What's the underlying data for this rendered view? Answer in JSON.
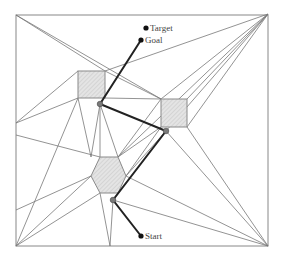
{
  "diagram": {
    "title": "",
    "labels": {
      "target": "Target",
      "goal": "Goal",
      "start": "Start"
    },
    "colors": {
      "border": "#888888",
      "edge": "#777777",
      "obstacle_fill": "#d9d9d9",
      "obstacle_stroke": "#8a8a8a",
      "path": "#222222",
      "node": "#7a7a7a",
      "point": "#111111"
    },
    "obstacles": [
      {
        "name": "square-obstacle-1",
        "shape": "square"
      },
      {
        "name": "square-obstacle-2",
        "shape": "square"
      },
      {
        "name": "hexagon-obstacle",
        "shape": "hexagon"
      }
    ],
    "path_nodes": [
      "Start",
      "node-1",
      "node-2",
      "node-3",
      "Goal"
    ]
  }
}
